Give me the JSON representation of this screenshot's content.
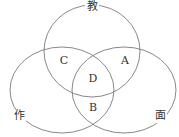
{
  "diagram": {
    "type": "venn-3",
    "stroke_color": "#7a7a7a",
    "text_color": "#333333",
    "sets": [
      {
        "name": "教",
        "cx": 92,
        "cy": 51,
        "rx": 48,
        "ry": 46
      },
      {
        "name": "作",
        "cx": 62,
        "cy": 90,
        "rx": 52,
        "ry": 43
      },
      {
        "name": "面",
        "cx": 124,
        "cy": 90,
        "rx": 52,
        "ry": 43
      }
    ],
    "set_labels": [
      {
        "text": "教",
        "x": 92,
        "y": 10
      },
      {
        "text": "作",
        "x": 19,
        "y": 119
      },
      {
        "text": "面",
        "x": 160,
        "y": 119
      }
    ],
    "region_labels": [
      {
        "text": "C",
        "x": 64,
        "y": 64
      },
      {
        "text": "A",
        "x": 125,
        "y": 64
      },
      {
        "text": "D",
        "x": 93,
        "y": 82
      },
      {
        "text": "B",
        "x": 93,
        "y": 111
      }
    ]
  }
}
